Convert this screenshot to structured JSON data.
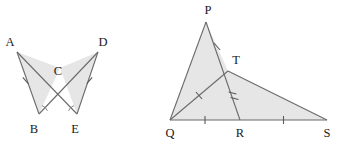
{
  "image": {
    "width": 340,
    "height": 146,
    "background_color": "#ffffff",
    "description": "Two geometry diagrams: a pair of triangles meeting at a point, and a triangle with interior cevians"
  },
  "style": {
    "stroke_color": "#6b6b6b",
    "stroke_color_dark": "#555555",
    "fill_color": "#e6e6e6",
    "tick_color": "#5a5a5a",
    "label_color": "#1a1a1a",
    "stroke_width": 1.1,
    "tick_width": 1.0,
    "label_font_size": 12.5
  },
  "figures": [
    {
      "id": "figure-left",
      "name": "bowtie-triangles-abc-dec",
      "vertices": [
        {
          "name": "A",
          "label": "A",
          "x": 17,
          "y": 52,
          "label_x": 10,
          "label_y": 46
        },
        {
          "name": "B",
          "label": "B",
          "x": 39,
          "y": 114,
          "label_x": 34,
          "label_y": 133
        },
        {
          "name": "C",
          "label": "C",
          "x": 60,
          "y": 68,
          "label_x": 58,
          "label_y": 75
        },
        {
          "name": "D",
          "label": "D",
          "x": 98,
          "y": 52,
          "label_x": 103,
          "label_y": 46
        },
        {
          "name": "E",
          "label": "E",
          "x": 77,
          "y": 114,
          "label_x": 75,
          "label_y": 133
        }
      ],
      "polygons": [
        {
          "name": "triangle-abc",
          "points": "17,52 39,114 60,68"
        },
        {
          "name": "triangle-dec",
          "points": "98,52 77,114 60,68"
        }
      ],
      "segments": [
        {
          "name": "segment-ab",
          "from": "A",
          "to": "B",
          "ticks": 1
        },
        {
          "name": "segment-ae",
          "from": "A",
          "to": "E",
          "ticks": 0
        },
        {
          "name": "segment-bd",
          "from": "B",
          "to": "D",
          "ticks": 0
        },
        {
          "name": "segment-de",
          "from": "D",
          "to": "E",
          "ticks": 1
        }
      ],
      "tick_marks": [
        {
          "name": "tick-ab",
          "x": 25.5,
          "y": 80.5,
          "angle": 70,
          "length": 8
        },
        {
          "name": "tick-de",
          "x": 89.5,
          "y": 80.5,
          "angle": 110,
          "length": 8
        }
      ],
      "angle_arcs": [
        {
          "name": "angle-arc-b",
          "x": 39,
          "y": 114,
          "radius": 9,
          "start_angle": -72,
          "end_angle": -20
        },
        {
          "name": "angle-arc-e",
          "x": 77,
          "y": 114,
          "radius": 9,
          "start_angle": -160,
          "end_angle": -108
        }
      ]
    },
    {
      "id": "figure-right",
      "name": "triangle-pqs-with-cevians",
      "vertices": [
        {
          "name": "P",
          "label": "P",
          "x": 206,
          "y": 22,
          "label_x": 208,
          "label_y": 14
        },
        {
          "name": "Q",
          "label": "Q",
          "x": 170,
          "y": 120,
          "label_x": 170,
          "label_y": 137
        },
        {
          "name": "R",
          "label": "R",
          "x": 240,
          "y": 120,
          "label_x": 240,
          "label_y": 137
        },
        {
          "name": "S",
          "label": "S",
          "x": 327,
          "y": 120,
          "label_x": 327,
          "label_y": 137
        },
        {
          "name": "T",
          "label": "T",
          "x": 228,
          "y": 71,
          "label_x": 236,
          "label_y": 64
        }
      ],
      "polygons": [
        {
          "name": "triangle-pqt",
          "points": "206,22 170,120 228,71"
        },
        {
          "name": "triangle-qts",
          "points": "170,120 228,71 327,120"
        }
      ],
      "segments": [
        {
          "name": "segment-pq",
          "from": "P",
          "to": "Q",
          "ticks": 0
        },
        {
          "name": "segment-pt",
          "from": "P",
          "to": "T",
          "ticks": 1
        },
        {
          "name": "segment-ts",
          "from": "T",
          "to": "S",
          "ticks": 0
        },
        {
          "name": "segment-qt",
          "from": "Q",
          "to": "T",
          "ticks": 1
        },
        {
          "name": "segment-tr",
          "from": "T",
          "to": "R",
          "ticks": 2
        },
        {
          "name": "segment-qs",
          "from": "Q",
          "to": "S",
          "ticks": 0
        },
        {
          "name": "segment-qr",
          "from": "Q",
          "to": "R",
          "ticks": 1
        },
        {
          "name": "segment-rs",
          "from": "R",
          "to": "S",
          "ticks": 1
        }
      ],
      "tick_marks": [
        {
          "name": "tick-pt",
          "x": 217,
          "y": 46.5,
          "angle": 40,
          "length": 8
        },
        {
          "name": "tick-qt",
          "x": 199,
          "y": 95.5,
          "angle": 140,
          "length": 8
        },
        {
          "name": "tick-tr-1",
          "x": 232.5,
          "y": 93,
          "angle": 76,
          "length": 8
        },
        {
          "name": "tick-tr-2",
          "x": 235,
          "y": 99,
          "angle": 76,
          "length": 8
        },
        {
          "name": "tick-qr",
          "x": 205,
          "y": 120,
          "angle": 90,
          "length": 8
        },
        {
          "name": "tick-rs",
          "x": 283.5,
          "y": 120,
          "angle": 90,
          "length": 8
        }
      ]
    }
  ]
}
